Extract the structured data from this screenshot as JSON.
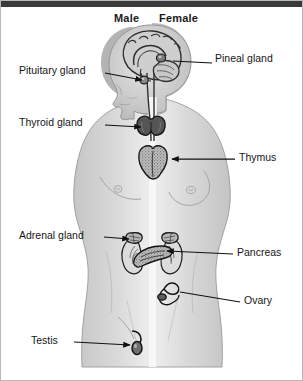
{
  "diagram": {
    "type": "anatomical-illustration",
    "colors": {
      "page_background": "#ffffff",
      "top_bar": "#3a3a3a",
      "border": "#b9b9b9",
      "body_fill": "#d2d2d2",
      "body_fill_light": "#e2e2e2",
      "body_outline": "#8c8c8c",
      "organ_dark": "#4c4c4c",
      "organ_mid": "#9a9a9a",
      "organ_light": "#cfcfcf",
      "leader_line": "#111111",
      "text": "#161616",
      "divider": "#f7f7f7"
    }
  },
  "headers": {
    "male": "Male",
    "female": "Female"
  },
  "labels": {
    "pituitary": {
      "text": "Pituitary gland",
      "side": "left",
      "x": 18,
      "y": 68,
      "line_from_x": 104,
      "line_from_y": 72,
      "line_to_x": 140,
      "line_to_y": 79
    },
    "pineal": {
      "text": "Pineal gland",
      "side": "right",
      "x": 214,
      "y": 56,
      "line_from_x": 207,
      "line_from_y": 62,
      "line_to_x": 176,
      "line_to_y": 62
    },
    "thyroid": {
      "text": "Thyroid gland",
      "side": "left",
      "x": 18,
      "y": 118,
      "line_from_x": 104,
      "line_from_y": 123,
      "line_to_x": 146,
      "line_to_y": 125
    },
    "thymus": {
      "text": "Thymus",
      "side": "right",
      "x": 238,
      "y": 152,
      "line_from_x": 232,
      "line_from_y": 158,
      "line_to_x": 174,
      "line_to_y": 158
    },
    "adrenal": {
      "text": "Adrenal gland",
      "side": "left",
      "x": 18,
      "y": 231,
      "line_from_x": 103,
      "line_from_y": 236,
      "line_to_x": 131,
      "line_to_y": 238
    },
    "pancreas": {
      "text": "Pancreas",
      "side": "right",
      "x": 236,
      "y": 248,
      "line_from_x": 231,
      "line_from_y": 253,
      "line_to_x": 163,
      "line_to_y": 249
    },
    "ovary": {
      "text": "Ovary",
      "side": "right",
      "x": 243,
      "y": 296,
      "line_from_x": 238,
      "line_from_y": 301,
      "line_to_x": 178,
      "line_to_y": 295
    },
    "testis": {
      "text": "Testis",
      "side": "left",
      "x": 30,
      "y": 336,
      "line_from_x": 73,
      "line_from_y": 341,
      "line_to_x": 132,
      "line_to_y": 344
    }
  },
  "organs": [
    {
      "name": "pituitary-gland",
      "label": "Pituitary gland"
    },
    {
      "name": "pineal-gland",
      "label": "Pineal gland"
    },
    {
      "name": "thyroid-gland",
      "label": "Thyroid gland"
    },
    {
      "name": "thymus",
      "label": "Thymus"
    },
    {
      "name": "adrenal-gland",
      "label": "Adrenal gland"
    },
    {
      "name": "pancreas",
      "label": "Pancreas"
    },
    {
      "name": "ovary",
      "label": "Ovary"
    },
    {
      "name": "testis",
      "label": "Testis"
    }
  ]
}
